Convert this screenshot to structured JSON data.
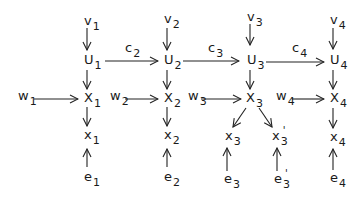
{
  "diagram": {
    "nodes": {
      "v1": {
        "base": "v",
        "sub": "1"
      },
      "v2": {
        "base": "v",
        "sub": "2"
      },
      "v3": {
        "base": "v",
        "sub": "3"
      },
      "v4": {
        "base": "v",
        "sub": "4"
      },
      "U1": {
        "base": "U",
        "sub": "1"
      },
      "U2": {
        "base": "U",
        "sub": "2"
      },
      "U3": {
        "base": "U",
        "sub": "3"
      },
      "U4": {
        "base": "U",
        "sub": "4"
      },
      "X1": {
        "base": "X",
        "sub": "1"
      },
      "X2": {
        "base": "X",
        "sub": "2"
      },
      "X3": {
        "base": "X",
        "sub": "3"
      },
      "X4": {
        "base": "X",
        "sub": "4"
      },
      "w1": {
        "base": "w",
        "sub": "1"
      },
      "w2": {
        "base": "w",
        "sub": "2"
      },
      "w3": {
        "base": "w",
        "sub": "3"
      },
      "w4": {
        "base": "w",
        "sub": "4"
      },
      "x1": {
        "base": "x",
        "sub": "1"
      },
      "x2": {
        "base": "x",
        "sub": "2"
      },
      "x3": {
        "base": "x",
        "sub": "3"
      },
      "x3p": {
        "base": "x",
        "sub": "3",
        "prime": "'"
      },
      "x4": {
        "base": "x",
        "sub": "4"
      },
      "e1": {
        "base": "e",
        "sub": "1"
      },
      "e2": {
        "base": "e",
        "sub": "2"
      },
      "e3": {
        "base": "e",
        "sub": "3"
      },
      "e3p": {
        "base": "e",
        "sub": "3",
        "prime": "'"
      },
      "e4": {
        "base": "e",
        "sub": "4"
      }
    },
    "edge_labels": {
      "c2": {
        "base": "c",
        "sub": "2"
      },
      "c3": {
        "base": "c",
        "sub": "3"
      },
      "c4": {
        "base": "c",
        "sub": "4"
      }
    },
    "edges": [
      {
        "from": "v1",
        "to": "U1"
      },
      {
        "from": "v2",
        "to": "U2"
      },
      {
        "from": "v3",
        "to": "U3"
      },
      {
        "from": "v4",
        "to": "U4"
      },
      {
        "from": "U1",
        "to": "U2",
        "label": "c2"
      },
      {
        "from": "U2",
        "to": "U3",
        "label": "c3"
      },
      {
        "from": "U3",
        "to": "U4",
        "label": "c4"
      },
      {
        "from": "U1",
        "to": "X1"
      },
      {
        "from": "U2",
        "to": "X2"
      },
      {
        "from": "U3",
        "to": "X3"
      },
      {
        "from": "U4",
        "to": "X4"
      },
      {
        "from": "w1",
        "to": "X1"
      },
      {
        "from": "w2",
        "to": "X2"
      },
      {
        "from": "w3",
        "to": "X3"
      },
      {
        "from": "w4",
        "to": "X4"
      },
      {
        "from": "X1",
        "to": "x1"
      },
      {
        "from": "X2",
        "to": "x2"
      },
      {
        "from": "X3",
        "to": "x3"
      },
      {
        "from": "X3",
        "to": "x3p"
      },
      {
        "from": "X4",
        "to": "x4"
      },
      {
        "from": "e1",
        "to": "x1"
      },
      {
        "from": "e2",
        "to": "x2"
      },
      {
        "from": "e3",
        "to": "x3"
      },
      {
        "from": "e3p",
        "to": "x3p"
      },
      {
        "from": "e4",
        "to": "x4"
      }
    ]
  }
}
